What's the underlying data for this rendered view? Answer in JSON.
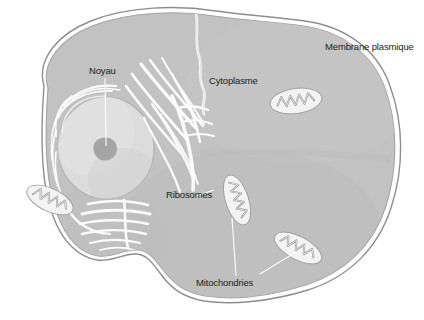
{
  "figure": {
    "language": "fr",
    "style": "grayscale-illustration"
  },
  "labels": {
    "membrane": "Membrane plasmique",
    "noyau": "Noyau",
    "cytoplasme": "Cytoplasme",
    "ribosomes": "Ribosomes",
    "mitochondries": "Mitochondries"
  },
  "colors": {
    "background": "#ffffff",
    "cytoplasm_fill": "#c2c2c2",
    "cytoplasm_shade": "#b8b8b8",
    "membrane_outline": "#8e8e8e",
    "membrane_gap": "#ffffff",
    "nucleus_fill": "#dcdcdc",
    "nucleus_outline": "#b0b0b0",
    "nucleolus_fill": "#a9a9a9",
    "organelle_fill": "#f2f2f2",
    "organelle_outline": "#9a9a9a",
    "er_stroke": "#fbfbfb",
    "leader_line": "#fdfdfd",
    "text": "#1b1b1b"
  },
  "structures": {
    "membrane_plasmique": {
      "name": "Membrane plasmique",
      "description": "Contour externe de la cellule, tracé double avec liseré blanc"
    },
    "cytoplasme": {
      "name": "Cytoplasme",
      "description": "Milieu gris remplissant la cellule"
    },
    "noyau": {
      "name": "Noyau",
      "description": "Grande sphère claire à gauche contenant un nucléole sombre"
    },
    "nucleole": {
      "name": "Nucléole",
      "description": "Petite tache gris foncé au centre du noyau"
    },
    "reticulum": {
      "name": "Réticulum endoplasmique / Ribosomes",
      "description": "Stries blanches incurvées rayonnant autour du noyau"
    },
    "mitochondries": {
      "name": "Mitochondries",
      "count": 4,
      "description": "Organites ovales clairs à crêtes en zigzag"
    }
  },
  "leader_lines": [
    {
      "from": "noyau-label",
      "to": "nucleole"
    },
    {
      "from": "ribosomes-label",
      "to": "reticulum"
    },
    {
      "from": "mitochondries-label",
      "to": "mitochondrie-centre"
    },
    {
      "from": "mitochondries-label",
      "to": "mitochondrie-droite-bas"
    }
  ]
}
